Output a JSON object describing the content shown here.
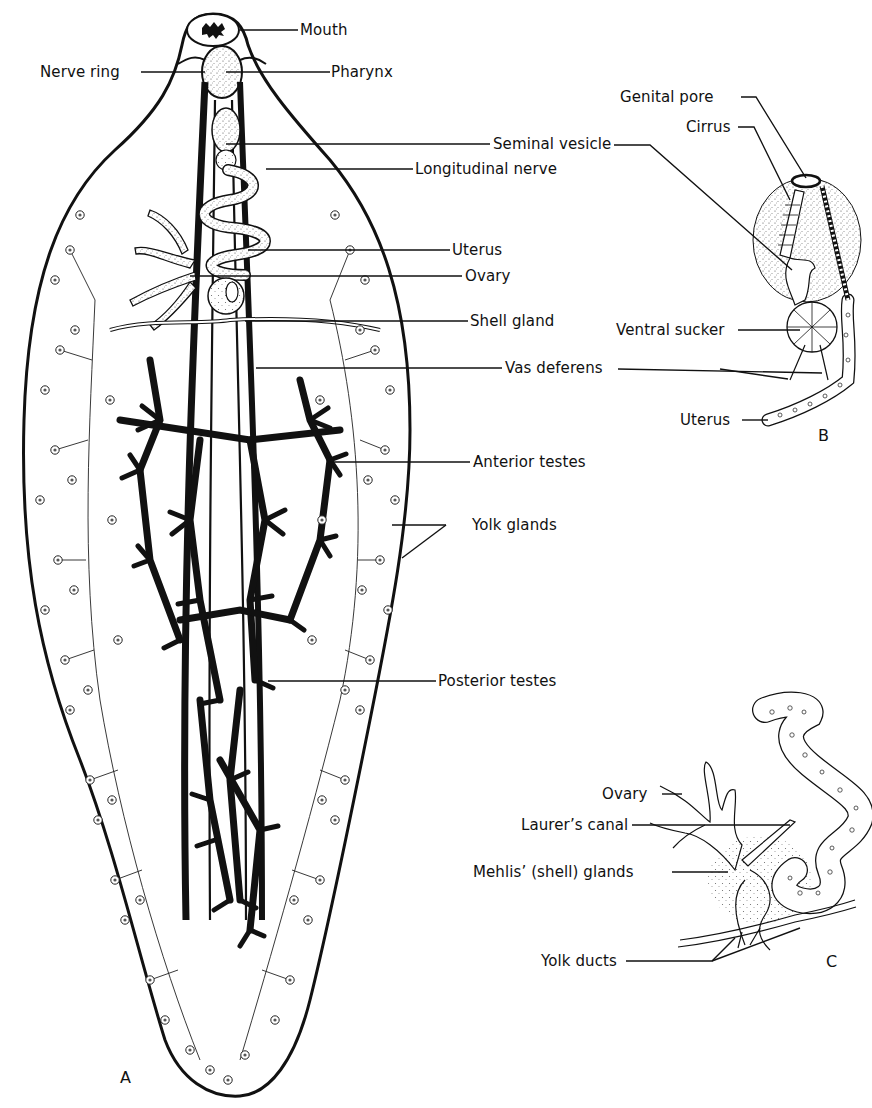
{
  "figure": {
    "panels": [
      {
        "id": "A",
        "label": "A",
        "subject": "Whole fluke (dorsal view)"
      },
      {
        "id": "B",
        "label": "B",
        "subject": "Terminal genitalia"
      },
      {
        "id": "C",
        "label": "C",
        "subject": "Ovary and shell gland complex"
      }
    ],
    "panel_a_labels": {
      "mouth": "Mouth",
      "nerve_ring": "Nerve ring",
      "pharynx": "Pharynx",
      "seminal_vesicle": "Seminal vesicle",
      "longitudinal_nerve": "Longitudinal nerve",
      "uterus": "Uterus",
      "ovary": "Ovary",
      "shell_gland": "Shell gland",
      "vas_deferens": "Vas deferens",
      "anterior_testes": "Anterior testes",
      "yolk_glands": "Yolk glands",
      "posterior_testes": "Posterior testes"
    },
    "panel_b_labels": {
      "genital_pore": "Genital pore",
      "cirrus": "Cirrus",
      "ventral_sucker": "Ventral sucker",
      "uterus": "Uterus"
    },
    "panel_c_labels": {
      "ovary": "Ovary",
      "laurers_canal": "Laurer’s canal",
      "mehlis_glands": "Mehlis’ (shell) glands",
      "yolk_ducts": "Yolk ducts"
    }
  },
  "colors": {
    "ink": "#111111",
    "background": "#ffffff",
    "stipple": "#dcdcdc"
  }
}
